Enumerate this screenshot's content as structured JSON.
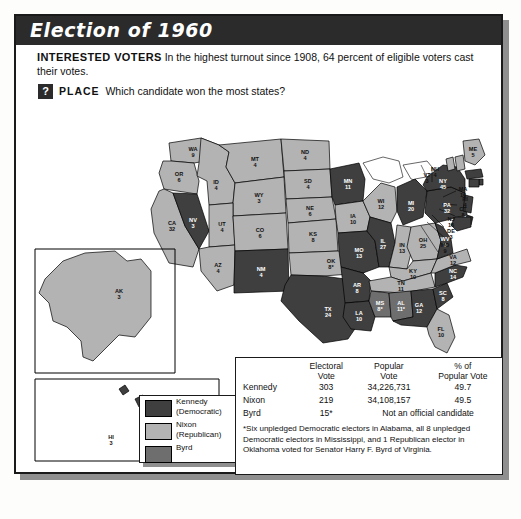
{
  "title": "Election of 1960",
  "intro": {
    "lead": "INTERESTED VOTERS",
    "text": "In the highest turnout since 1908, 64 percent of eligible voters cast their votes.",
    "question_icon": "?",
    "question_label": "PLACE",
    "question_text": "Which candidate won the most states?"
  },
  "legend": {
    "items": [
      {
        "label": "Kennedy\n(Democratic)",
        "color": "#3f3f3f",
        "name": "kennedy"
      },
      {
        "label": "Nixon\n(Republican)",
        "color": "#b3b3b3",
        "name": "nixon"
      },
      {
        "label": "Byrd",
        "color": "#6e6e6e",
        "name": "byrd"
      }
    ]
  },
  "table": {
    "headers": [
      "",
      "Electoral Vote",
      "Popular Vote",
      "% of Popular Vote"
    ],
    "header_lines": [
      [
        "",
        ""
      ],
      [
        "Electoral",
        "Vote"
      ],
      [
        "Popular",
        "Vote"
      ],
      [
        "% of",
        "Popular Vote"
      ]
    ],
    "rows": [
      {
        "candidate": "Kennedy",
        "electoral": "303",
        "popular": "34,226,731",
        "pct": "49.7"
      },
      {
        "candidate": "Nixon",
        "electoral": "219",
        "popular": "34,108,157",
        "pct": "49.5"
      },
      {
        "candidate": "Byrd",
        "electoral": "15*",
        "popular": "Not an official candidate",
        "pct": ""
      }
    ],
    "footnote": "*Six unpledged Democratic electors in Alabama, all 8 unpledged Democratic electors in Mississippi, and 1 Republican elector in Oklahoma voted for Senator Harry F. Byrd of Virginia."
  },
  "chart_data": {
    "type": "map",
    "title": "Election of 1960",
    "legend_position": "bottom-left",
    "colors": {
      "kennedy": "#3f3f3f",
      "nixon": "#b3b3b3",
      "byrd": "#6e6e6e",
      "water": "#ffffff"
    },
    "totals": {
      "kennedy_electoral": 303,
      "nixon_electoral": 219,
      "byrd_electoral": 15,
      "kennedy_popular": 34226731,
      "nixon_popular": 34108157,
      "kennedy_pct": 49.7,
      "nixon_pct": 49.5,
      "turnout_pct": 64
    },
    "states": [
      {
        "code": "WA",
        "votes": "9",
        "winner": "nixon"
      },
      {
        "code": "OR",
        "votes": "6",
        "winner": "nixon"
      },
      {
        "code": "CA",
        "votes": "32",
        "winner": "nixon"
      },
      {
        "code": "NV",
        "votes": "3",
        "winner": "kennedy"
      },
      {
        "code": "ID",
        "votes": "4",
        "winner": "nixon"
      },
      {
        "code": "MT",
        "votes": "4",
        "winner": "nixon"
      },
      {
        "code": "WY",
        "votes": "3",
        "winner": "nixon"
      },
      {
        "code": "UT",
        "votes": "4",
        "winner": "nixon"
      },
      {
        "code": "AZ",
        "votes": "4",
        "winner": "nixon"
      },
      {
        "code": "CO",
        "votes": "6",
        "winner": "nixon"
      },
      {
        "code": "NM",
        "votes": "4",
        "winner": "kennedy"
      },
      {
        "code": "ND",
        "votes": "4",
        "winner": "nixon"
      },
      {
        "code": "SD",
        "votes": "4",
        "winner": "nixon"
      },
      {
        "code": "NE",
        "votes": "6",
        "winner": "nixon"
      },
      {
        "code": "KS",
        "votes": "8",
        "winner": "nixon"
      },
      {
        "code": "OK",
        "votes": "8*",
        "winner": "nixon"
      },
      {
        "code": "TX",
        "votes": "24",
        "winner": "kennedy"
      },
      {
        "code": "MN",
        "votes": "11",
        "winner": "kennedy"
      },
      {
        "code": "IA",
        "votes": "10",
        "winner": "nixon"
      },
      {
        "code": "MO",
        "votes": "13",
        "winner": "kennedy"
      },
      {
        "code": "AR",
        "votes": "8",
        "winner": "kennedy"
      },
      {
        "code": "LA",
        "votes": "10",
        "winner": "kennedy"
      },
      {
        "code": "WI",
        "votes": "12",
        "winner": "nixon"
      },
      {
        "code": "IL",
        "votes": "27",
        "winner": "kennedy"
      },
      {
        "code": "MI",
        "votes": "20",
        "winner": "kennedy"
      },
      {
        "code": "IN",
        "votes": "13",
        "winner": "nixon"
      },
      {
        "code": "OH",
        "votes": "25",
        "winner": "nixon"
      },
      {
        "code": "KY",
        "votes": "10",
        "winner": "nixon"
      },
      {
        "code": "TN",
        "votes": "11",
        "winner": "nixon"
      },
      {
        "code": "MS",
        "votes": "8*",
        "winner": "byrd"
      },
      {
        "code": "AL",
        "votes": "11*",
        "winner": "byrd"
      },
      {
        "code": "GA",
        "votes": "12",
        "winner": "kennedy"
      },
      {
        "code": "FL",
        "votes": "10",
        "winner": "nixon"
      },
      {
        "code": "SC",
        "votes": "8",
        "winner": "kennedy"
      },
      {
        "code": "NC",
        "votes": "14",
        "winner": "kennedy"
      },
      {
        "code": "VA",
        "votes": "12",
        "winner": "nixon"
      },
      {
        "code": "WV",
        "votes": "8",
        "winner": "kennedy"
      },
      {
        "code": "PA",
        "votes": "32",
        "winner": "kennedy"
      },
      {
        "code": "NY",
        "votes": "45",
        "winner": "kennedy"
      },
      {
        "code": "VT",
        "votes": "3",
        "winner": "nixon"
      },
      {
        "code": "NH",
        "votes": "4",
        "winner": "nixon"
      },
      {
        "code": "ME",
        "votes": "5",
        "winner": "nixon"
      },
      {
        "code": "MA",
        "votes": "16",
        "winner": "kennedy"
      },
      {
        "code": "RI",
        "votes": "4",
        "winner": "kennedy"
      },
      {
        "code": "CT",
        "votes": "8",
        "winner": "kennedy"
      },
      {
        "code": "NJ",
        "votes": "16",
        "winner": "kennedy"
      },
      {
        "code": "DE",
        "votes": "3",
        "winner": "kennedy"
      },
      {
        "code": "MD",
        "votes": "9",
        "winner": "kennedy"
      },
      {
        "code": "AK",
        "votes": "3",
        "winner": "nixon"
      },
      {
        "code": "HI",
        "votes": "3",
        "winner": "kennedy"
      }
    ]
  }
}
